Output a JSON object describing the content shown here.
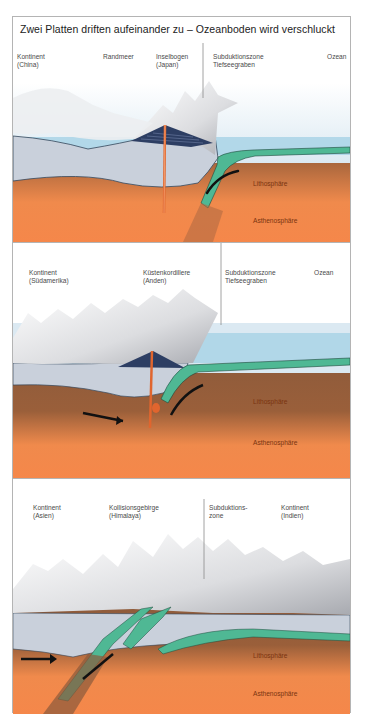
{
  "figure": {
    "title": "Zwei Platten driften aufeinander zu – Ozeanboden wird verschluckt",
    "colors": {
      "asthenosphere": "#f5874a",
      "lithosphere": "#8a5a3c",
      "oceanic_crust": "#4fb894",
      "continental_crust": "#c9d0db",
      "ocean": "#a9d3e6",
      "sky": "#ffffff",
      "mountains": "#e8e8e8",
      "frame": "#b4b4b4"
    }
  },
  "panels": [
    {
      "id": "ocean-continent-island-arc",
      "labels": {
        "continent": "Kontinent",
        "continent_sub": "(China)",
        "marginal_sea": "Randmeer",
        "island_arc": "Inselbogen",
        "island_arc_sub": "(Japan)",
        "subduction": "Subduktionszone",
        "trench": "Tiefseegraben",
        "ocean": "Ozean",
        "lithosphere": "Lithosphäre",
        "asthenosphere": "Asthenosphäre"
      }
    },
    {
      "id": "ocean-continent-coastal-range",
      "labels": {
        "continent": "Kontinent",
        "continent_sub": "(Südamerika)",
        "coastal_range": "Küstenkordillere",
        "coastal_range_sub": "(Anden)",
        "subduction": "Subduktionszone",
        "trench": "Tiefseegraben",
        "ocean": "Ozean",
        "lithosphere": "Lithosphäre",
        "asthenosphere": "Asthenosphäre"
      }
    },
    {
      "id": "continent-continent-collision",
      "labels": {
        "continent_left": "Kontinent",
        "continent_left_sub": "(Asien)",
        "collision_range": "Kollisionsgebirge",
        "collision_range_sub": "(Himalaya)",
        "subduction": "Subduktions-",
        "subduction_sub": "zone",
        "continent_right": "Kontinent",
        "continent_right_sub": "(Indien)",
        "lithosphere": "Lithosphäre",
        "asthenosphere": "Asthenosphäre"
      }
    }
  ]
}
